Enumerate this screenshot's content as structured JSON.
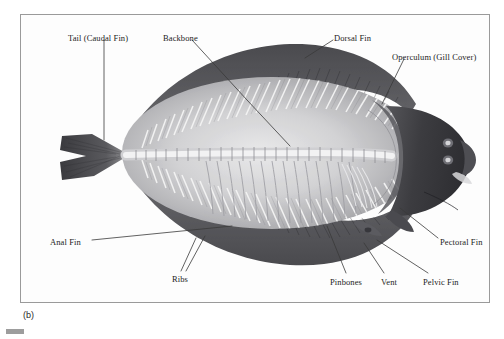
{
  "figure": {
    "caption": "(b)",
    "frame": {
      "x": 20,
      "y": 14,
      "width": 470,
      "height": 289,
      "border_color": "#9a9a9a"
    },
    "background_color": "#ffffff",
    "plate_color": "#fdfdfd",
    "label_color": "#1c1c1c",
    "leader_color": "#3a3a3a"
  },
  "labels": [
    {
      "id": "tail-caudal-fin",
      "text": "Tail (Caudal Fin)",
      "text_x": 68,
      "text_y": 33,
      "leader": [
        [
          104,
          40
        ],
        [
          104,
          140
        ]
      ],
      "anchor": "start"
    },
    {
      "id": "backbone",
      "text": "Backbone",
      "text_x": 163,
      "text_y": 33,
      "leader": [
        [
          192,
          40
        ],
        [
          247,
          100
        ],
        [
          290,
          146
        ]
      ],
      "anchor": "start"
    },
    {
      "id": "dorsal-fin",
      "text": "Dorsal Fin",
      "text_x": 334,
      "text_y": 33,
      "leader": [
        [
          333,
          40
        ],
        [
          305,
          58
        ]
      ],
      "anchor": "start"
    },
    {
      "id": "operculum-gill-cover",
      "text": "Operculum (Gill Cover)",
      "text_x": 392,
      "text_y": 52,
      "leader": [
        [
          404,
          59
        ],
        [
          382,
          104
        ]
      ],
      "anchor": "start"
    },
    {
      "id": "anal-fin",
      "text": "Anal Fin",
      "text_x": 50,
      "text_y": 237,
      "leader": [
        [
          92,
          240
        ],
        [
          232,
          226
        ]
      ],
      "anchor": "start"
    },
    {
      "id": "ribs",
      "text": "Ribs",
      "text_x": 172,
      "text_y": 274,
      "leader": [
        [
          181,
          271
        ],
        [
          196,
          238
        ]
      ],
      "leader2": [
        [
          186,
          271
        ],
        [
          205,
          236
        ]
      ],
      "anchor": "start"
    },
    {
      "id": "pinbones",
      "text": "Pinbones",
      "text_x": 330,
      "text_y": 277,
      "leader": [
        [
          346,
          273
        ],
        [
          327,
          226
        ]
      ],
      "anchor": "start"
    },
    {
      "id": "vent",
      "text": "Vent",
      "text_x": 381,
      "text_y": 277,
      "leader": [
        [
          384,
          273
        ],
        [
          364,
          243
        ]
      ],
      "anchor": "start"
    },
    {
      "id": "pelvic-fin",
      "text": "Pelvic Fin",
      "text_x": 423,
      "text_y": 277,
      "leader": [
        [
          428,
          273
        ],
        [
          377,
          240
        ]
      ],
      "anchor": "start"
    },
    {
      "id": "pectoral-fin",
      "text": "Pectoral Fin",
      "text_x": 440,
      "text_y": 237,
      "leader": [
        [
          438,
          238
        ],
        [
          400,
          208
        ]
      ],
      "anchor": "start"
    }
  ],
  "anatomy": {
    "body_outline_note": "oval flatfish body, head right, tail left",
    "head_tone": "#3f3f43",
    "fin_band_tone": "#4a4a4e",
    "bone_tone": "#efefef",
    "flesh_tone": "#b9b9bb",
    "eye_count": 2
  }
}
